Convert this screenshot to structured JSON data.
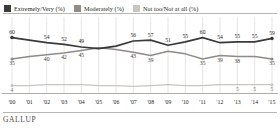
{
  "legend": {
    "items": [
      {
        "label": "Extremely/Very (%)",
        "color": "#3a3a3a",
        "icon": "legend-swatch-icon"
      },
      {
        "label": "Moderately (%)",
        "color": "#8e8b88",
        "icon": "legend-swatch-icon"
      },
      {
        "label": "Not too/Not at all (%)",
        "color": "#c8c5c2",
        "icon": "legend-swatch-icon"
      }
    ]
  },
  "footer": {
    "brand": "GALLUP"
  },
  "chart_data": {
    "type": "line",
    "title": "",
    "subtitle": "",
    "xlabel": "",
    "ylabel": "",
    "ylim": [
      0,
      70
    ],
    "grid": "vertical",
    "legend_position": "top-left",
    "categories": [
      "'00",
      "'01",
      "'02",
      "'03",
      "'04",
      "'05",
      "'06",
      "'07",
      "'08",
      "'09",
      "'10",
      "'11",
      "'12",
      "'13",
      "'14",
      "'15"
    ],
    "series": [
      {
        "name": "Extremely/Very (%)",
        "color": "#3a3a3a",
        "values": [
          60,
          57,
          54,
          52,
          49,
          47,
          50,
          56,
          57,
          51,
          55,
          60,
          54,
          55,
          55,
          59
        ],
        "labels": [
          "60",
          "",
          "54",
          "52",
          "49",
          "",
          "",
          "56",
          "57",
          "51",
          "55",
          "60",
          "54",
          "55",
          "55",
          "59"
        ]
      },
      {
        "name": "Moderately (%)",
        "color": "#8e8b88",
        "values": [
          35,
          38,
          40,
          42,
          45,
          48,
          46,
          43,
          39,
          44,
          41,
          35,
          39,
          38,
          38,
          35
        ],
        "labels": [
          "35",
          "",
          "40",
          "42",
          "45",
          "",
          "",
          "43",
          "39",
          "",
          "",
          "35",
          "39",
          "38",
          "",
          "35"
        ]
      },
      {
        "name": "Not too/Not at all (%)",
        "color": "#c8c5c2",
        "values": [
          4,
          4,
          5,
          5,
          5,
          4,
          4,
          3,
          4,
          5,
          4,
          4,
          5,
          5,
          5,
          5
        ],
        "labels": [
          "4",
          "",
          "",
          "",
          "",
          "",
          "",
          "",
          "",
          "",
          "",
          "",
          "",
          "5",
          "5",
          "5"
        ]
      }
    ]
  }
}
